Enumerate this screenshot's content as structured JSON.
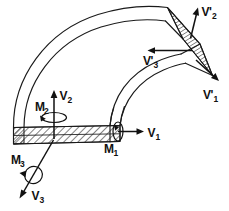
{
  "figure": {
    "background_color": "#ffffff",
    "line_color": "#1a1a1a"
  },
  "labels": {
    "v1": {
      "base": "V",
      "sub": "1",
      "prime": ""
    },
    "v2": {
      "base": "V",
      "sub": "2",
      "prime": ""
    },
    "v3": {
      "base": "V",
      "sub": "3",
      "prime": ""
    },
    "m1": {
      "base": "M",
      "sub": "1",
      "prime": ""
    },
    "m2": {
      "base": "M",
      "sub": "2",
      "prime": ""
    },
    "m3": {
      "base": "M",
      "sub": "3",
      "prime": ""
    },
    "v1p": {
      "base": "V",
      "sub": "1",
      "prime": "'"
    },
    "v2p": {
      "base": "V",
      "sub": "2",
      "prime": "'"
    },
    "v3p": {
      "base": "V",
      "sub": "3",
      "prime": "'"
    }
  },
  "vectors": [
    {
      "name": "V1",
      "label": "V",
      "subscript": "1",
      "primed": false,
      "direction": "right",
      "origin": "near-end-cross-section"
    },
    {
      "name": "V2",
      "label": "V",
      "subscript": "2",
      "primed": false,
      "direction": "up",
      "origin": "near-end-top-surface"
    },
    {
      "name": "V3",
      "label": "V",
      "subscript": "3",
      "primed": false,
      "direction": "down-left",
      "origin": "near-end-front-face"
    },
    {
      "name": "V'1",
      "label": "V",
      "subscript": "1",
      "primed": true,
      "direction": "down-right",
      "origin": "far-end-cross-section"
    },
    {
      "name": "V'2",
      "label": "V",
      "subscript": "2",
      "primed": true,
      "direction": "up-right",
      "origin": "far-end-cross-section"
    },
    {
      "name": "V'3",
      "label": "V",
      "subscript": "3",
      "primed": true,
      "direction": "left",
      "origin": "far-end-cross-section"
    }
  ],
  "moments": [
    {
      "name": "M1",
      "label": "M",
      "subscript": "1",
      "axis": "V1",
      "rotation_sense": "counterclockwise"
    },
    {
      "name": "M2",
      "label": "M",
      "subscript": "2",
      "axis": "V2",
      "rotation_sense": "counterclockwise"
    },
    {
      "name": "M3",
      "label": "M",
      "subscript": "3",
      "axis": "V3",
      "rotation_sense": "counterclockwise"
    }
  ],
  "geometry": {
    "body": "quarter-circular curved beam of rectangular cross-section",
    "near_end": "straight hatched slab segment, horizontal",
    "far_end": "hatched cut cross-section face, inclined",
    "hatch_style": "diagonal-line-hatching"
  }
}
